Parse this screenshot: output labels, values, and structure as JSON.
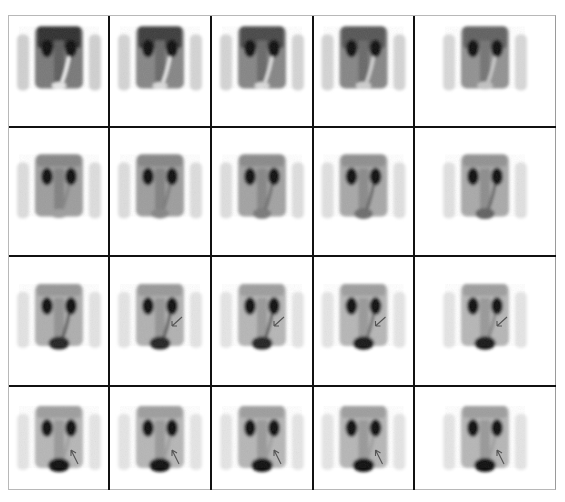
{
  "figure": {
    "rows": 4,
    "cols": 5,
    "colors": {
      "background": "#ffffff",
      "grid_line": "#111111",
      "outer_border": "#b8b8b8",
      "tracer": "#0a0a0a",
      "arrow": "#555555"
    },
    "frames": [
      {
        "row": 0,
        "col": 0,
        "arrow": null,
        "bladder": 0.1,
        "ureter": 0.0,
        "bg": 0.55
      },
      {
        "row": 0,
        "col": 1,
        "arrow": null,
        "bladder": 0.15,
        "ureter": 0.05,
        "bg": 0.5
      },
      {
        "row": 0,
        "col": 2,
        "arrow": null,
        "bladder": 0.15,
        "ureter": 0.1,
        "bg": 0.5
      },
      {
        "row": 0,
        "col": 3,
        "arrow": null,
        "bladder": 0.2,
        "ureter": 0.15,
        "bg": 0.5
      },
      {
        "row": 0,
        "col": 4,
        "arrow": null,
        "bladder": 0.25,
        "ureter": 0.2,
        "bg": 0.45
      },
      {
        "row": 1,
        "col": 0,
        "arrow": null,
        "bladder": 0.4,
        "ureter": 0.5,
        "bg": 0.4
      },
      {
        "row": 1,
        "col": 1,
        "arrow": null,
        "bladder": 0.5,
        "ureter": 0.55,
        "bg": 0.4
      },
      {
        "row": 1,
        "col": 2,
        "arrow": null,
        "bladder": 0.55,
        "ureter": 0.6,
        "bg": 0.38
      },
      {
        "row": 1,
        "col": 3,
        "arrow": null,
        "bladder": 0.6,
        "ureter": 0.65,
        "bg": 0.36
      },
      {
        "row": 1,
        "col": 4,
        "arrow": null,
        "bladder": 0.65,
        "ureter": 0.65,
        "bg": 0.35
      },
      {
        "row": 2,
        "col": 0,
        "arrow": null,
        "bladder": 0.9,
        "ureter": 0.7,
        "bg": 0.33
      },
      {
        "row": 2,
        "col": 1,
        "arrow": "down-left",
        "bladder": 0.9,
        "ureter": 0.7,
        "bg": 0.32
      },
      {
        "row": 2,
        "col": 2,
        "arrow": "down-left",
        "bladder": 0.9,
        "ureter": 0.7,
        "bg": 0.3
      },
      {
        "row": 2,
        "col": 3,
        "arrow": "down-left",
        "bladder": 0.95,
        "ureter": 0.6,
        "bg": 0.3
      },
      {
        "row": 2,
        "col": 4,
        "arrow": "down-left",
        "bladder": 0.95,
        "ureter": 0.5,
        "bg": 0.3
      },
      {
        "row": 3,
        "col": 0,
        "arrow": "up-left",
        "bladder": 1.0,
        "ureter": 0.4,
        "bg": 0.3
      },
      {
        "row": 3,
        "col": 1,
        "arrow": "up-left",
        "bladder": 1.0,
        "ureter": 0.4,
        "bg": 0.3
      },
      {
        "row": 3,
        "col": 2,
        "arrow": "up-left",
        "bladder": 1.0,
        "ureter": 0.4,
        "bg": 0.3
      },
      {
        "row": 3,
        "col": 3,
        "arrow": "up-left",
        "bladder": 1.0,
        "ureter": 0.4,
        "bg": 0.3
      },
      {
        "row": 3,
        "col": 4,
        "arrow": "up-left",
        "bladder": 1.0,
        "ureter": 0.4,
        "bg": 0.3
      }
    ]
  }
}
